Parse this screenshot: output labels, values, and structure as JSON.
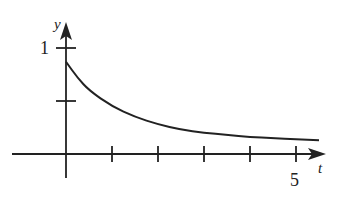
{
  "chart_data": {
    "type": "line",
    "title": "",
    "xlabel": "t",
    "ylabel": "y",
    "x_tick_labels": [
      {
        "value": 5,
        "label": "5"
      }
    ],
    "y_tick_labels": [
      {
        "value": 1,
        "label": "1"
      }
    ],
    "x_ticks": [
      1,
      2,
      3,
      4,
      5
    ],
    "y_ticks": [
      0.5,
      1
    ],
    "xlim": [
      0,
      5.6
    ],
    "ylim": [
      0,
      1.1
    ],
    "grid": false,
    "legend": "none",
    "series": [
      {
        "name": "y(t)",
        "x": [
          0,
          0.25,
          0.5,
          1,
          1.5,
          2,
          2.5,
          3,
          3.5,
          4,
          4.5,
          5,
          5.5
        ],
        "y": [
          0.87,
          0.72,
          0.6,
          0.45,
          0.35,
          0.28,
          0.23,
          0.2,
          0.18,
          0.16,
          0.15,
          0.14,
          0.13
        ]
      }
    ]
  },
  "labels": {
    "y_axis": "y",
    "x_axis": "t",
    "one": "1",
    "five": "5"
  }
}
